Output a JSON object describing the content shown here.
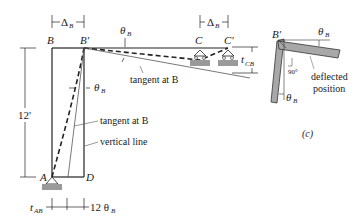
{
  "figure": {
    "caption_c": "(c)",
    "nodes": {
      "B": "B",
      "B_prime": "B'",
      "C": "C",
      "C_prime": "C'",
      "A": "A",
      "D": "D"
    },
    "dimensions": {
      "delta_top_left": "Δ",
      "delta_top_left_sub": "B",
      "delta_top_right": "Δ",
      "delta_top_right_sub": "B",
      "height": "12'",
      "t_cb": "t",
      "t_cb_sub": "CB",
      "t_ab": "t",
      "t_ab_sub": "AB",
      "twelve_theta": "12 θ",
      "twelve_theta_sub": "B"
    },
    "angles": {
      "theta_top": "θ",
      "theta_top_sub": "B",
      "theta_col": "θ",
      "theta_col_sub": "B"
    },
    "labels": {
      "tangent_top": "tangent at B",
      "tangent_col": "tangent at B",
      "vertical_line": "vertical line"
    },
    "detail": {
      "node": "B'",
      "theta_top": "θ",
      "theta_top_sub": "B",
      "theta_bottom": "θ",
      "theta_bottom_sub": "B",
      "angle": "90°",
      "deflected_1": "deflected",
      "deflected_2": "position"
    }
  }
}
